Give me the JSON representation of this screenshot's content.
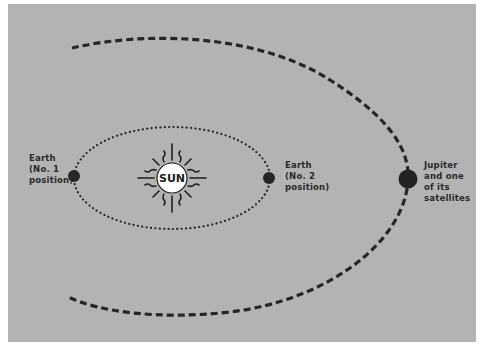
{
  "diagram": {
    "type": "orbit-diagram",
    "background_color": "#b3b3b3",
    "ink_color": "#1f1f1f",
    "sun": {
      "label": "SUN",
      "cx": 172,
      "cy": 178,
      "r": 15
    },
    "earth_orbit": {
      "style": "dotted",
      "cx": 172,
      "cy": 178,
      "rx": 98,
      "ry": 51
    },
    "jupiter_orbit": {
      "style": "dashed"
    },
    "bodies": [
      {
        "id": "earth-1",
        "cx": 74,
        "cy": 176,
        "r": 6
      },
      {
        "id": "earth-2",
        "cx": 269,
        "cy": 178,
        "r": 6
      },
      {
        "id": "jupiter",
        "cx": 408,
        "cy": 179,
        "r": 9
      }
    ],
    "labels": {
      "earth_1": {
        "line1": "Earth",
        "line2": "(No. 1",
        "line3": "position)"
      },
      "earth_2": {
        "line1": "Earth",
        "line2": "(No. 2",
        "line3": "position)"
      },
      "jupiter": {
        "line1": "Jupiter",
        "line2": "and one",
        "line3": "of its",
        "line4": "satellites"
      }
    }
  }
}
